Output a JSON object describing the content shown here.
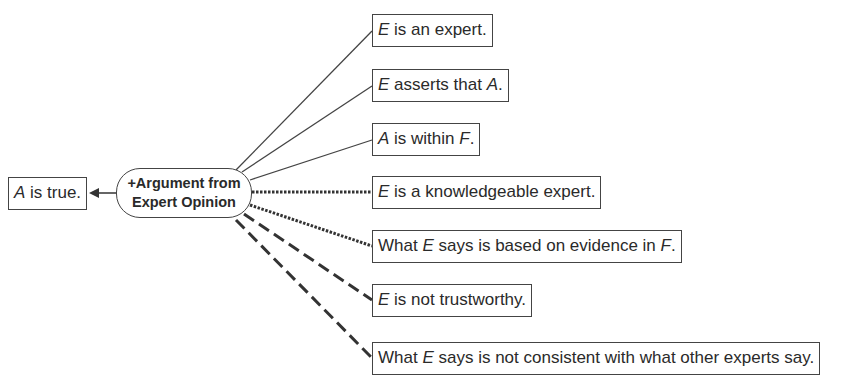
{
  "diagram": {
    "conclusion": {
      "italic": "A",
      "text": " is true."
    },
    "scheme": {
      "line1": "+Argument from",
      "line2": "Expert Opinion"
    },
    "premises": [
      {
        "parts": [
          {
            "i": "E"
          },
          {
            "t": " is an expert."
          }
        ],
        "link": "solid"
      },
      {
        "parts": [
          {
            "i": "E"
          },
          {
            "t": " asserts that "
          },
          {
            "i": "A"
          },
          {
            "t": "."
          }
        ],
        "link": "solid"
      },
      {
        "parts": [
          {
            "i": "A"
          },
          {
            "t": " is within "
          },
          {
            "i": "F"
          },
          {
            "t": "."
          }
        ],
        "link": "solid"
      },
      {
        "parts": [
          {
            "i": "E"
          },
          {
            "t": " is a knowledgeable expert."
          }
        ],
        "link": "dotted"
      },
      {
        "parts": [
          {
            "t": "What "
          },
          {
            "i": "E"
          },
          {
            "t": " says is based on evidence in "
          },
          {
            "i": "F"
          },
          {
            "t": "."
          }
        ],
        "link": "dotted"
      },
      {
        "parts": [
          {
            "i": "E"
          },
          {
            "t": " is not trustworthy."
          }
        ],
        "link": "dashed"
      },
      {
        "parts": [
          {
            "t": "What "
          },
          {
            "i": "E"
          },
          {
            "t": " says is not consistent with what other experts say."
          }
        ],
        "link": "dashed"
      }
    ]
  }
}
